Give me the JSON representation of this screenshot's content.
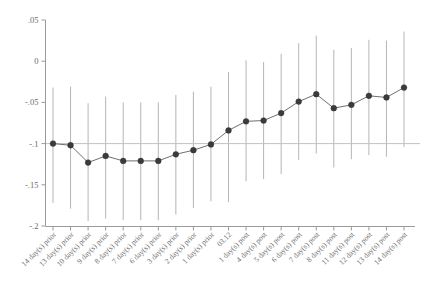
{
  "chart_data": {
    "type": "scatter",
    "title": "",
    "subtitle": "",
    "xlabel": "",
    "ylabel": "",
    "ylim": [
      -0.2,
      0.05
    ],
    "ytick_values": [
      0.05,
      0,
      -0.05,
      -0.1,
      -0.15,
      -0.2
    ],
    "ytick_labels": [
      ".05",
      "0",
      "-.05",
      "-.1",
      "-.15",
      "-.2"
    ],
    "grid": false,
    "legend": null,
    "reference_line_y": -0.1,
    "categories": [
      "14 day(s) prior",
      "13 day(s) prior",
      "10 day(s) prior",
      "9 day(s) prior",
      "8 day(s) prior",
      "7 day(s) prior",
      "6 day(s) prior",
      "3 day(s) prior",
      "2 day(s) prior",
      "1 day(s) prior",
      "03.12",
      "1 day(s) post",
      "4 day(s) post",
      "5 day(s) post",
      "6 day(s) post",
      "7 day(s) post",
      "8 day(s) post",
      "11 day(s) post",
      "12 day(s) post",
      "13 day(s) post",
      "14 day(s) post"
    ],
    "series": [
      {
        "name": "point estimate",
        "values": [
          -0.1,
          -0.102,
          -0.123,
          -0.115,
          -0.121,
          -0.121,
          -0.121,
          -0.113,
          -0.108,
          -0.101,
          -0.084,
          -0.073,
          -0.072,
          -0.063,
          -0.049,
          -0.04,
          -0.057,
          -0.053,
          -0.042,
          -0.044,
          -0.032
        ]
      },
      {
        "name": "ci_lower",
        "values": [
          -0.172,
          -0.179,
          -0.194,
          -0.191,
          -0.193,
          -0.193,
          -0.193,
          -0.186,
          -0.178,
          -0.17,
          -0.171,
          -0.146,
          -0.143,
          -0.137,
          -0.12,
          -0.112,
          -0.129,
          -0.119,
          -0.114,
          -0.116,
          -0.104
        ]
      },
      {
        "name": "ci_upper",
        "values": [
          -0.032,
          -0.031,
          -0.051,
          -0.043,
          -0.05,
          -0.05,
          -0.05,
          -0.041,
          -0.037,
          -0.031,
          -0.013,
          0.001,
          -0.001,
          0.009,
          0.022,
          0.031,
          0.014,
          0.016,
          0.026,
          0.025,
          0.036
        ]
      }
    ]
  },
  "axis": {
    "y_tick_0": ".05",
    "y_tick_1": "0",
    "y_tick_2": "-.05",
    "y_tick_3": "-.1",
    "y_tick_4": "-.15",
    "y_tick_5": "-.2"
  },
  "colors": {
    "marker": "#3b3b3b",
    "line": "#6f6f6f",
    "ci": "#b5b5b5",
    "axis": "#9a9a9a",
    "reference": "#c2c2c2",
    "text": "#6b6b6b",
    "background": "#ffffff"
  }
}
